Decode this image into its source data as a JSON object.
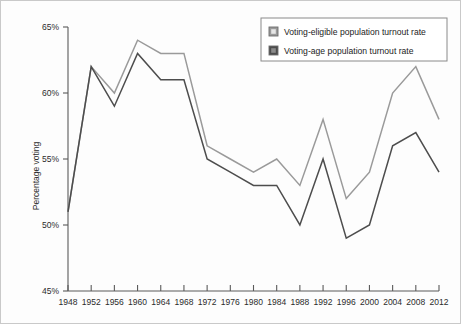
{
  "chart_data": {
    "type": "line",
    "title": "",
    "xlabel": "",
    "ylabel": "Percentage voting",
    "x": [
      1948,
      1952,
      1956,
      1960,
      1964,
      1968,
      1972,
      1976,
      1980,
      1984,
      1988,
      1992,
      1996,
      2000,
      2004,
      2008,
      2012
    ],
    "categories": [
      "1948",
      "1952",
      "1956",
      "1960",
      "1964",
      "1968",
      "1972",
      "1976",
      "1980",
      "1984",
      "1988",
      "1992",
      "1996",
      "2000",
      "2004",
      "2008",
      "2012"
    ],
    "xlim": [
      1948,
      2012
    ],
    "ylim": [
      45,
      65
    ],
    "ytick_values": [
      45,
      50,
      55,
      60,
      65
    ],
    "ytick_labels": [
      "45%",
      "50%",
      "55%",
      "60%",
      "65%"
    ],
    "grid": false,
    "legend_position": "top-right",
    "series": [
      {
        "name": "Voting-eligible population turnout rate",
        "color": "#9a9a9a",
        "values": [
          51,
          62,
          60,
          64,
          63,
          63,
          56,
          55,
          54,
          55,
          53,
          58,
          52,
          54,
          60,
          62,
          58
        ]
      },
      {
        "name": "Voting-age population turnout rate",
        "color": "#4d4d4d",
        "values": [
          51,
          62,
          59,
          63,
          61,
          61,
          55,
          54,
          53,
          53,
          50,
          55,
          49,
          50,
          56,
          57,
          54
        ]
      }
    ]
  },
  "legend": {
    "items": [
      {
        "label": "Voting-eligible population turnout rate",
        "swatch_color": "#9a9a9a"
      },
      {
        "label": "Voting-age population turnout rate",
        "swatch_color": "#4d4d4d"
      }
    ]
  },
  "axes": {
    "y_title": "Percentage voting"
  }
}
